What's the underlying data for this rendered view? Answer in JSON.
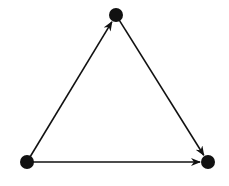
{
  "diagram": {
    "type": "directed-graph",
    "width": 229,
    "height": 186,
    "colors": {
      "node": "#111111",
      "edge": "#111111",
      "background": "#ffffff"
    },
    "node_radius": 7,
    "nodes": [
      {
        "id": "top",
        "x": 116,
        "y": 15
      },
      {
        "id": "bottom-left",
        "x": 27,
        "y": 162
      },
      {
        "id": "bottom-right",
        "x": 208,
        "y": 162
      }
    ],
    "edges": [
      {
        "from": "bottom-left",
        "to": "top"
      },
      {
        "from": "top",
        "to": "bottom-right"
      },
      {
        "from": "bottom-left",
        "to": "bottom-right"
      }
    ]
  }
}
